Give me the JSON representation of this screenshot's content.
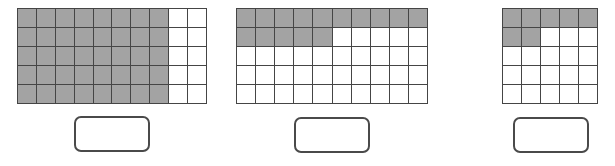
{
  "colors": {
    "shaded": "#a3a3a3",
    "unshaded": "#ffffff",
    "grid_line": "#454545",
    "box_border": "#4a4a4a"
  },
  "figures": [
    {
      "id": "grid-1",
      "columns": 10,
      "rows": 5,
      "total_cells": 50,
      "shaded_cells": 40,
      "shading_pattern": "first 8 columns of every row",
      "shaded_map": [
        [
          1,
          1,
          1,
          1,
          1,
          1,
          1,
          1,
          0,
          0
        ],
        [
          1,
          1,
          1,
          1,
          1,
          1,
          1,
          1,
          0,
          0
        ],
        [
          1,
          1,
          1,
          1,
          1,
          1,
          1,
          1,
          0,
          0
        ],
        [
          1,
          1,
          1,
          1,
          1,
          1,
          1,
          1,
          0,
          0
        ],
        [
          1,
          1,
          1,
          1,
          1,
          1,
          1,
          1,
          0,
          0
        ]
      ],
      "answer_box": {
        "value": ""
      }
    },
    {
      "id": "grid-2",
      "columns": 10,
      "rows": 5,
      "total_cells": 50,
      "shaded_cells": 15,
      "shading_pattern": "full first row plus first 5 cells of second row",
      "shaded_map": [
        [
          1,
          1,
          1,
          1,
          1,
          1,
          1,
          1,
          1,
          1
        ],
        [
          1,
          1,
          1,
          1,
          1,
          0,
          0,
          0,
          0,
          0
        ],
        [
          0,
          0,
          0,
          0,
          0,
          0,
          0,
          0,
          0,
          0
        ],
        [
          0,
          0,
          0,
          0,
          0,
          0,
          0,
          0,
          0,
          0
        ],
        [
          0,
          0,
          0,
          0,
          0,
          0,
          0,
          0,
          0,
          0
        ]
      ],
      "answer_box": {
        "value": ""
      }
    },
    {
      "id": "grid-3",
      "columns": 5,
      "rows": 5,
      "total_cells": 25,
      "shaded_cells": 7,
      "shading_pattern": "full first row plus first 2 cells of second row",
      "shaded_map": [
        [
          1,
          1,
          1,
          1,
          1
        ],
        [
          1,
          1,
          0,
          0,
          0
        ],
        [
          0,
          0,
          0,
          0,
          0
        ],
        [
          0,
          0,
          0,
          0,
          0
        ],
        [
          0,
          0,
          0,
          0,
          0
        ]
      ],
      "answer_box": {
        "value": ""
      }
    }
  ]
}
